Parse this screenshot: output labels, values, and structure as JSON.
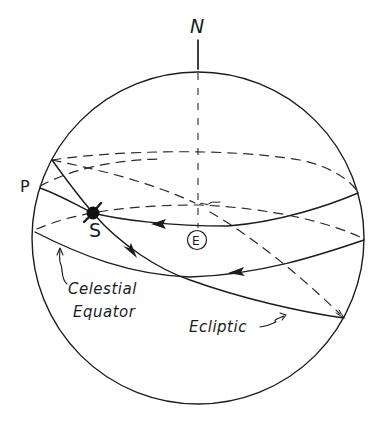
{
  "diagram": {
    "labels": {
      "north": "N",
      "point_p": "P",
      "sun": "S",
      "earth": "E",
      "celestial_equator_line1": "Celestial",
      "celestial_equator_line2": "Equator",
      "ecliptic": "Ecliptic"
    },
    "elements": [
      {
        "id": "celestial-sphere",
        "shape": "circle"
      },
      {
        "id": "north-pole-axis",
        "shape": "line",
        "label": "N"
      },
      {
        "id": "earth-marker",
        "shape": "circle",
        "label": "E"
      },
      {
        "id": "sun-marker",
        "shape": "filled-dot",
        "label": "S"
      },
      {
        "id": "celestial-equator",
        "shape": "great-circle",
        "label": "Celestial Equator"
      },
      {
        "id": "ecliptic",
        "shape": "great-circle",
        "label": "Ecliptic"
      },
      {
        "id": "sun-daily-path",
        "shape": "small-circle",
        "start_label": "P"
      }
    ],
    "colors": {
      "ink": "#1c1c1c",
      "background": "#ffffff"
    }
  }
}
